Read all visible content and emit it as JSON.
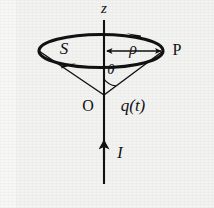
{
  "figure": {
    "background_color": "#f2f2f1",
    "ink_color": "#111111"
  },
  "labels": {
    "axis_z": "z",
    "surface_s": "S",
    "radius_rho": "ρ",
    "point_p": "P",
    "angle_theta": "θ",
    "origin_o": "O",
    "charge_qt": "q(t)",
    "current_i": "I"
  },
  "elements": {
    "z_axis": {
      "name": "vertical z axis line",
      "x": 104,
      "y_top": 20,
      "y_bottom": 184
    },
    "loop_ellipse": {
      "name": "current loop drawn in perspective as an ellipse",
      "cx": 101,
      "cy": 51,
      "rx": 62,
      "ry": 17
    },
    "cone": {
      "name": "cone slant lines from apex to loop rim",
      "apex_x": 104,
      "apex_y": 95,
      "left_rim_x": 39,
      "left_rim_y": 51,
      "right_rim_x": 163,
      "right_rim_y": 51
    },
    "rho_arrow": {
      "name": "double headed radius arrow",
      "x_start": 105,
      "x_end": 163,
      "y": 51
    },
    "current_arrow": {
      "name": "upward current arrow on the z axis",
      "x": 104,
      "y_tip": 139,
      "y_tail": 160
    },
    "loop_arrowheads": [
      {
        "name": "back-arc arrowhead pointing left",
        "x": 133,
        "y": 35,
        "direction": "left"
      },
      {
        "name": "front-arc arrowhead pointing right",
        "x": 69,
        "y": 66,
        "direction": "right"
      }
    ],
    "theta_arc": {
      "name": "angle arc at cone apex",
      "cx": 104,
      "cy": 95,
      "radius": 16
    }
  }
}
